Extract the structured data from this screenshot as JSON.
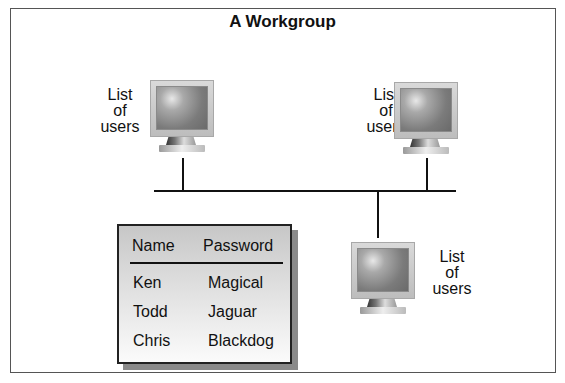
{
  "diagram": {
    "title": "A Workgroup",
    "workstations": [
      {
        "label_lines": [
          "List",
          "of",
          "users"
        ]
      },
      {
        "label_lines": [
          "List",
          "of",
          "users"
        ]
      },
      {
        "label_lines": [
          "List",
          "of",
          "users"
        ]
      }
    ],
    "user_table": {
      "headers": [
        "Name",
        "Password"
      ],
      "rows": [
        [
          "Ken",
          "Magical"
        ],
        [
          "Todd",
          "Jaguar"
        ],
        [
          "Chris",
          "Blackdog"
        ]
      ]
    },
    "colors": {
      "line": "#111111",
      "frame_border": "#555555",
      "table_border": "#222222",
      "table_shadow": "#8a8a8a"
    }
  }
}
